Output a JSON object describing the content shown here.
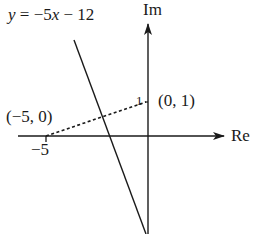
{
  "diagram": {
    "equation_label": "y = −5x − 12",
    "equation_parts": {
      "y": "y",
      "mid": " = −5",
      "x": "x",
      "tail": " − 12"
    },
    "axes": {
      "imaginary_label": "Im",
      "real_label": "Re"
    },
    "ticks": {
      "real_minus5": "−5",
      "imag_1": "1"
    },
    "points": [
      {
        "label": "(−5, 0)",
        "re": -5,
        "im": 0
      },
      {
        "label": "(0, 1)",
        "re": 0,
        "im": 1
      }
    ],
    "line": {
      "slope": -5,
      "intercept": -12
    },
    "colors": {
      "ink": "#1a1a1a",
      "background": "#ffffff"
    }
  }
}
